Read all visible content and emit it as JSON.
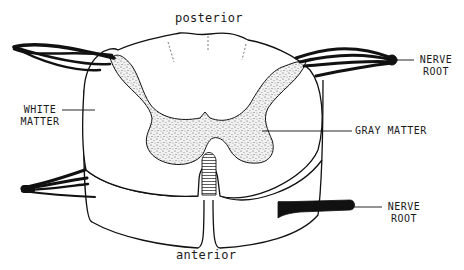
{
  "diagram": {
    "labels": {
      "posterior": "posterior",
      "anterior": "anterior",
      "white_matter_line1": "WHITE",
      "white_matter_line2": "MATTER",
      "gray_matter": "GRAY MATTER",
      "nerve_root_top_line1": "NERVE",
      "nerve_root_top_line2": "ROOT",
      "nerve_root_bottom_line1": "NERVE",
      "nerve_root_bottom_line2": "ROOT"
    },
    "colors": {
      "line": "#111111",
      "gray_matter_fill": "#d8d8d8",
      "background": "#ffffff"
    }
  }
}
